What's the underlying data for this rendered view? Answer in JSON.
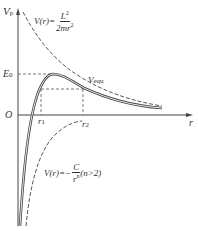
{
  "diagram": {
    "y_axis_label": "V",
    "y_axis_sub": "p",
    "x_axis_label": "r",
    "origin_label": "O",
    "e0_label": "E",
    "e0_sub": "0",
    "r1_label": "r",
    "r1_sub": "1",
    "r2_label": "r",
    "r2_sub": "2",
    "vequ_label": "V",
    "vequ_sub": "equ",
    "centrifugal": {
      "lhs": "V(r)=",
      "numerator": "L",
      "numerator_sup": "2",
      "denominator": "2mr",
      "denominator_sup": "2"
    },
    "attractive": {
      "lhs": "V(r)=−",
      "numerator": "C",
      "denominator": "r",
      "denominator_sup": "n",
      "condition": "(n>2)"
    },
    "colors": {
      "line": "#444444",
      "text": "#333333"
    }
  }
}
